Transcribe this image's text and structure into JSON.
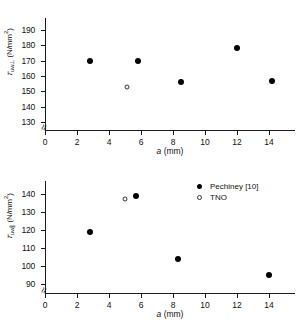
{
  "chart_data": [
    {
      "id": "top",
      "type": "scatter",
      "title": "",
      "xlabel": "a (mm)",
      "ylabel": "τuw⊥ (N/mm2)",
      "ylabel_symbol": "τ",
      "ylabel_sub": "uw⊥",
      "ylabel_unit_pre": "(N/mm",
      "ylabel_unit_sup": "2",
      "ylabel_unit_post": ")",
      "xlim": [
        0,
        15
      ],
      "ylim": [
        125,
        195
      ],
      "xticks": [
        0,
        2,
        4,
        6,
        8,
        10,
        12,
        14
      ],
      "yticks": [
        130,
        140,
        150,
        160,
        170,
        180,
        190
      ],
      "grid": false,
      "axis_break": true,
      "legend_position": "none",
      "series": [
        {
          "name": "Pechiney [10]",
          "marker": "filled-circle",
          "points": [
            {
              "x": 2.8,
              "y": 170
            },
            {
              "x": 5.8,
              "y": 170
            },
            {
              "x": 8.5,
              "y": 156
            },
            {
              "x": 12.0,
              "y": 178
            },
            {
              "x": 14.2,
              "y": 157
            }
          ]
        },
        {
          "name": "TNO",
          "marker": "open-circle",
          "points": [
            {
              "x": 5.1,
              "y": 153
            }
          ]
        }
      ]
    },
    {
      "id": "bottom",
      "type": "scatter",
      "title": "",
      "xlabel": "a (mm)",
      "ylabel": "τuw∥ (N/mm2)",
      "ylabel_symbol": "τ",
      "ylabel_sub": "uw∥",
      "ylabel_unit_pre": "(N/mm",
      "ylabel_unit_sup": "2",
      "ylabel_unit_post": ")",
      "xlim": [
        0,
        15
      ],
      "ylim": [
        85,
        145
      ],
      "xticks": [
        0,
        2,
        4,
        6,
        8,
        10,
        12,
        14
      ],
      "yticks": [
        90,
        100,
        110,
        120,
        130,
        140
      ],
      "grid": false,
      "axis_break": true,
      "legend_position": "top-right",
      "legend": [
        {
          "label": "Pechiney [10]",
          "marker": "filled-circle"
        },
        {
          "label": "TNO",
          "marker": "open-circle"
        }
      ],
      "series": [
        {
          "name": "Pechiney [10]",
          "marker": "filled-circle",
          "points": [
            {
              "x": 2.8,
              "y": 119
            },
            {
              "x": 5.7,
              "y": 139
            },
            {
              "x": 8.3,
              "y": 104
            },
            {
              "x": 14.0,
              "y": 95
            }
          ]
        },
        {
          "name": "TNO",
          "marker": "open-circle",
          "points": [
            {
              "x": 5.0,
              "y": 137
            }
          ]
        }
      ]
    }
  ]
}
